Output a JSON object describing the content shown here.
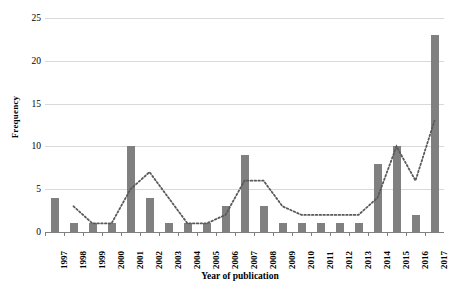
{
  "chart_data": {
    "type": "bar",
    "title": "",
    "xlabel": "Year of publication",
    "ylabel": "Frequency",
    "categories": [
      "1997",
      "1998",
      "1999",
      "2000",
      "2001",
      "2002",
      "2003",
      "2004",
      "2005",
      "2006",
      "2007",
      "2008",
      "2009",
      "2010",
      "2011",
      "2012",
      "2013",
      "2014",
      "2015",
      "2016",
      "2017"
    ],
    "values": [
      4,
      1,
      1,
      1,
      10,
      4,
      1,
      1,
      1,
      3,
      9,
      3,
      1,
      1,
      1,
      1,
      1,
      8,
      10,
      2,
      23
    ],
    "series": [
      {
        "name": "Frequency",
        "type": "bar",
        "color": "#808080",
        "values": [
          4,
          1,
          1,
          1,
          10,
          4,
          1,
          1,
          1,
          3,
          9,
          3,
          1,
          1,
          1,
          1,
          1,
          8,
          10,
          2,
          23
        ]
      },
      {
        "name": "Trend (moving average)",
        "type": "line",
        "style": "dotted",
        "color": "#595959",
        "values": [
          null,
          3,
          1,
          1,
          5,
          7,
          4,
          1,
          1,
          2,
          6,
          6,
          3,
          2,
          2,
          2,
          2,
          4,
          10,
          6,
          13
        ]
      }
    ],
    "ylim": [
      0,
      25
    ],
    "yticks": [
      0,
      5,
      10,
      15,
      20,
      25
    ],
    "ytick_labels": [
      "0",
      "5",
      "10",
      "15",
      "20",
      "25"
    ],
    "grid": true,
    "grid_axis": "y",
    "legend": "none",
    "xtick_rotation": -90,
    "bar_color": "#808080",
    "gridline_color": "#d9d9d9",
    "axis_color": "#808080"
  }
}
